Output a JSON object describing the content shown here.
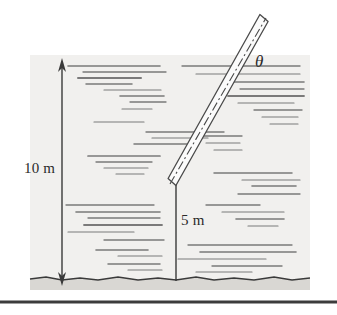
{
  "figure": {
    "background_color": "#ffffff",
    "water": {
      "name": "water-body",
      "fill_color": "#f1f0ee",
      "x": 30,
      "y": 55,
      "width": 280,
      "height": 225,
      "surface_y": 55,
      "hatch_color": "#5a5a5a"
    },
    "ground": {
      "name": "ground-bed",
      "fill_color": "#d9d7d3",
      "edge_color": "#3a3a3a",
      "top_y": 278,
      "bottom_y": 290
    },
    "bottom_rule": {
      "name": "page-bottom-rule",
      "color": "#3c3c3c",
      "y": 302,
      "thickness": 3
    }
  },
  "dimensions": {
    "depth": {
      "label": "10 m",
      "value": 10,
      "unit": "m",
      "arrow_x": 62,
      "top_y": 62,
      "bottom_y": 282,
      "style": "double-headed-arrow",
      "color": "#3a3a3a"
    },
    "submerged_length": {
      "label": "5 m",
      "value": 5,
      "unit": "m",
      "line_x": 176,
      "top_y": 181,
      "bottom_y": 280,
      "style": "plain-line",
      "color": "#3a3a3a"
    }
  },
  "rod": {
    "name": "rigid-rod",
    "outline_color": "#4a4a4a",
    "fill_color": "#fbfbfb",
    "centerline_style": "dash-dot",
    "bottom_tip": {
      "x": 172,
      "y": 182
    },
    "top_tip": {
      "x": 264,
      "y": 18
    },
    "half_width": 4.5
  },
  "angle": {
    "label": "θ",
    "name": "angle-theta",
    "symbol_unicode": "U+03B8",
    "x": 258,
    "y": 62
  },
  "water_lines": [
    {
      "x": 68,
      "y": 66,
      "len": 92,
      "w": 1.6
    },
    {
      "x": 83,
      "y": 72,
      "len": 83,
      "w": 1.3
    },
    {
      "x": 78,
      "y": 78,
      "len": 63,
      "w": 2.0
    },
    {
      "x": 86,
      "y": 84,
      "len": 46,
      "w": 1.5
    },
    {
      "x": 104,
      "y": 90,
      "len": 57,
      "w": 1.2
    },
    {
      "x": 120,
      "y": 96,
      "len": 44,
      "w": 1.6
    },
    {
      "x": 130,
      "y": 102,
      "len": 36,
      "w": 1.3
    },
    {
      "x": 122,
      "y": 109,
      "len": 30,
      "w": 1.1
    },
    {
      "x": 94,
      "y": 122,
      "len": 50,
      "w": 1.2
    },
    {
      "x": 146,
      "y": 132,
      "len": 78,
      "w": 1.4
    },
    {
      "x": 152,
      "y": 138,
      "len": 56,
      "w": 1.2
    },
    {
      "x": 134,
      "y": 144,
      "len": 62,
      "w": 1.5
    },
    {
      "x": 88,
      "y": 156,
      "len": 72,
      "w": 1.7
    },
    {
      "x": 96,
      "y": 162,
      "len": 56,
      "w": 1.3
    },
    {
      "x": 104,
      "y": 168,
      "len": 44,
      "w": 1.2
    },
    {
      "x": 116,
      "y": 174,
      "len": 28,
      "w": 1.1
    },
    {
      "x": 66,
      "y": 205,
      "len": 88,
      "w": 1.3
    },
    {
      "x": 76,
      "y": 212,
      "len": 84,
      "w": 1.6
    },
    {
      "x": 88,
      "y": 218,
      "len": 72,
      "w": 1.3
    },
    {
      "x": 84,
      "y": 225,
      "len": 78,
      "w": 1.8
    },
    {
      "x": 68,
      "y": 232,
      "len": 66,
      "w": 1.2
    },
    {
      "x": 104,
      "y": 240,
      "len": 60,
      "w": 1.4
    },
    {
      "x": 96,
      "y": 250,
      "len": 52,
      "w": 1.6
    },
    {
      "x": 118,
      "y": 256,
      "len": 44,
      "w": 1.2
    },
    {
      "x": 108,
      "y": 264,
      "len": 52,
      "w": 1.5
    },
    {
      "x": 128,
      "y": 270,
      "len": 34,
      "w": 1.2
    },
    {
      "x": 182,
      "y": 66,
      "len": 118,
      "w": 1.4
    },
    {
      "x": 196,
      "y": 74,
      "len": 104,
      "w": 1.2
    },
    {
      "x": 232,
      "y": 82,
      "len": 72,
      "w": 1.6
    },
    {
      "x": 240,
      "y": 89,
      "len": 64,
      "w": 1.3
    },
    {
      "x": 228,
      "y": 96,
      "len": 76,
      "w": 1.8
    },
    {
      "x": 238,
      "y": 103,
      "len": 56,
      "w": 1.2
    },
    {
      "x": 254,
      "y": 110,
      "len": 48,
      "w": 1.4
    },
    {
      "x": 262,
      "y": 117,
      "len": 36,
      "w": 1.2
    },
    {
      "x": 270,
      "y": 124,
      "len": 28,
      "w": 1.1
    },
    {
      "x": 196,
      "y": 136,
      "len": 46,
      "w": 1.3
    },
    {
      "x": 206,
      "y": 143,
      "len": 34,
      "w": 1.1
    },
    {
      "x": 214,
      "y": 150,
      "len": 28,
      "w": 1.2
    },
    {
      "x": 214,
      "y": 173,
      "len": 78,
      "w": 1.5
    },
    {
      "x": 242,
      "y": 180,
      "len": 58,
      "w": 1.2
    },
    {
      "x": 252,
      "y": 186,
      "len": 44,
      "w": 1.6
    },
    {
      "x": 238,
      "y": 194,
      "len": 62,
      "w": 1.3
    },
    {
      "x": 206,
      "y": 205,
      "len": 54,
      "w": 1.4
    },
    {
      "x": 222,
      "y": 212,
      "len": 62,
      "w": 1.2
    },
    {
      "x": 236,
      "y": 219,
      "len": 48,
      "w": 1.6
    },
    {
      "x": 248,
      "y": 226,
      "len": 30,
      "w": 1.2
    },
    {
      "x": 188,
      "y": 245,
      "len": 104,
      "w": 1.3
    },
    {
      "x": 200,
      "y": 252,
      "len": 96,
      "w": 1.6
    },
    {
      "x": 178,
      "y": 259,
      "len": 88,
      "w": 1.2
    },
    {
      "x": 212,
      "y": 266,
      "len": 70,
      "w": 1.4
    },
    {
      "x": 196,
      "y": 272,
      "len": 56,
      "w": 1.2
    }
  ]
}
